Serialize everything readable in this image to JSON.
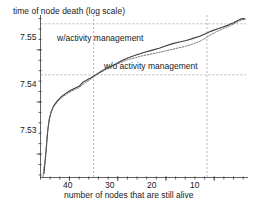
{
  "chart_data": {
    "type": "line",
    "title": "time of node death (log scale)",
    "xlabel": "number of nodes that are still alive",
    "ylabel": "time of node death (log scale)",
    "x_ticks": [
      40,
      30,
      20,
      10
    ],
    "x_tick_labels": [
      "40",
      "30",
      "20",
      "10"
    ],
    "y_ticks": [
      7.53,
      7.54,
      7.55
    ],
    "y_tick_labels": [
      "7.55",
      "7.54",
      "7.53"
    ],
    "xlim": [
      46,
      3
    ],
    "ylim": [
      7.5255,
      7.5565
    ],
    "x_axis_reversed": true,
    "grid": false,
    "legend": "inline-annotations",
    "annotations": [
      {
        "text": "w/activity management",
        "x": 38.0,
        "y": 7.5535
      },
      {
        "text": "w/o activity management",
        "x": 27.5,
        "y": 7.5475
      }
    ],
    "reference_lines": [
      {
        "orientation": "horizontal",
        "value": 7.555,
        "style": "dashed"
      },
      {
        "orientation": "horizontal",
        "value": 7.5452,
        "style": "dashed"
      },
      {
        "orientation": "vertical",
        "value": 35.0,
        "style": "dashed"
      },
      {
        "orientation": "vertical",
        "value": 11.5,
        "style": "dashed"
      }
    ],
    "series": [
      {
        "name": "w/activity management",
        "style": "solid",
        "color": "#3a3a3a",
        "points": [
          [
            45.3,
            7.5262
          ],
          [
            45.1,
            7.528
          ],
          [
            44.9,
            7.53
          ],
          [
            44.7,
            7.5322
          ],
          [
            44.5,
            7.5345
          ],
          [
            44.2,
            7.5366
          ],
          [
            43.8,
            7.5381
          ],
          [
            43.3,
            7.5392
          ],
          [
            42.6,
            7.5401
          ],
          [
            41.8,
            7.5409
          ],
          [
            41.0,
            7.5415
          ],
          [
            40.0,
            7.5421
          ],
          [
            39.0,
            7.5426
          ],
          [
            38.0,
            7.543
          ],
          [
            37.2,
            7.5438
          ],
          [
            36.4,
            7.5442
          ],
          [
            35.6,
            7.5446
          ],
          [
            34.6,
            7.5452
          ],
          [
            33.4,
            7.5459
          ],
          [
            32.0,
            7.5466
          ],
          [
            30.6,
            7.5472
          ],
          [
            29.2,
            7.5479
          ],
          [
            27.8,
            7.5485
          ],
          [
            26.2,
            7.549
          ],
          [
            24.6,
            7.5495
          ],
          [
            23.0,
            7.5499
          ],
          [
            21.4,
            7.5503
          ],
          [
            20.0,
            7.5508
          ],
          [
            18.6,
            7.5512
          ],
          [
            17.2,
            7.5515
          ],
          [
            15.8,
            7.5518
          ],
          [
            14.4,
            7.5522
          ],
          [
            13.0,
            7.5526
          ],
          [
            11.8,
            7.5531
          ],
          [
            10.6,
            7.5536
          ],
          [
            9.4,
            7.554
          ],
          [
            8.2,
            7.5544
          ],
          [
            7.0,
            7.5548
          ],
          [
            6.0,
            7.5552
          ],
          [
            5.2,
            7.5556
          ],
          [
            4.6,
            7.5559
          ],
          [
            4.0,
            7.556
          ],
          [
            3.6,
            7.5559
          ]
        ]
      },
      {
        "name": "w/o activity management",
        "style": "dotted",
        "color": "#6a6a6a",
        "points": [
          [
            45.5,
            7.5256
          ],
          [
            45.3,
            7.5272
          ],
          [
            45.0,
            7.5292
          ],
          [
            44.8,
            7.5314
          ],
          [
            44.6,
            7.5337
          ],
          [
            44.3,
            7.536
          ],
          [
            43.9,
            7.5377
          ],
          [
            43.4,
            7.5389
          ],
          [
            42.7,
            7.5398
          ],
          [
            41.9,
            7.5406
          ],
          [
            41.1,
            7.5412
          ],
          [
            40.1,
            7.5418
          ],
          [
            39.1,
            7.5423
          ],
          [
            38.1,
            7.5427
          ],
          [
            37.3,
            7.5433
          ],
          [
            36.5,
            7.5438
          ],
          [
            35.7,
            7.5443
          ],
          [
            34.7,
            7.545
          ],
          [
            33.5,
            7.5457
          ],
          [
            32.1,
            7.5464
          ],
          [
            30.7,
            7.547
          ],
          [
            29.3,
            7.5476
          ],
          [
            27.9,
            7.5481
          ],
          [
            26.3,
            7.5485
          ],
          [
            24.7,
            7.5489
          ],
          [
            23.1,
            7.5492
          ],
          [
            21.5,
            7.5495
          ],
          [
            20.1,
            7.5498
          ],
          [
            18.7,
            7.5501
          ],
          [
            17.3,
            7.5504
          ],
          [
            15.9,
            7.5507
          ],
          [
            14.5,
            7.5511
          ],
          [
            13.1,
            7.5516
          ],
          [
            11.9,
            7.5522
          ],
          [
            10.7,
            7.5529
          ],
          [
            9.5,
            7.5535
          ],
          [
            8.3,
            7.554
          ],
          [
            7.1,
            7.5545
          ],
          [
            6.1,
            7.5549
          ],
          [
            5.3,
            7.5553
          ],
          [
            4.7,
            7.5556
          ],
          [
            4.1,
            7.5558
          ],
          [
            3.7,
            7.5557
          ]
        ]
      }
    ]
  }
}
